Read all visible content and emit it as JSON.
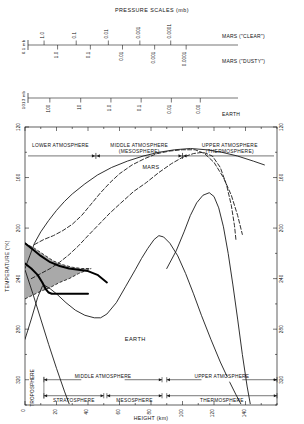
{
  "figure": {
    "pressure_scales_title": "PRESSURE SCALES (mb)",
    "xlabel": "HEIGHT (km)",
    "ylabel": "TEMPERATURE (°K)"
  },
  "pressure_scales": [
    {
      "name": "mars-clear",
      "row_label": "MARS (\"CLEAR\")",
      "origin_label": "6.1 mb",
      "side": "above",
      "ticks": [
        {
          "label": "1.0",
          "km": 12.5
        },
        {
          "label": "0.1",
          "km": 37.5
        },
        {
          "label": "0.01",
          "km": 62.5
        },
        {
          "label": "0.001",
          "km": 87.0
        },
        {
          "label": "0.0001",
          "km": 111.0
        }
      ]
    },
    {
      "name": "mars-dusty",
      "row_label": "MARS (\"DUSTY\")",
      "origin_label": "",
      "side": "below",
      "ticks": [
        {
          "label": "1.0",
          "km": 23.0
        },
        {
          "label": "0.1",
          "km": 48.5
        },
        {
          "label": "0.01",
          "km": 73.5
        },
        {
          "label": "0.001",
          "km": 98.5
        },
        {
          "label": "0.0001",
          "km": 123.0
        }
      ]
    },
    {
      "name": "earth",
      "row_label": "EARTH",
      "origin_label": "1013 mb",
      "side": "below",
      "ticks": [
        {
          "label": "100",
          "km": 17.0
        },
        {
          "label": "10",
          "km": 41.0
        },
        {
          "label": "1.0",
          "km": 64.5
        },
        {
          "label": "0.1",
          "km": 88.0
        },
        {
          "label": "0.01",
          "km": 111.5
        },
        {
          "label": "0.00",
          "km": 134.0
        }
      ]
    }
  ],
  "chart_data": {
    "type": "line",
    "title": "",
    "xlabel": "HEIGHT (km)",
    "ylabel": "TEMPERATURE (°K)",
    "xlim": [
      0,
      160
    ],
    "ylim": [
      120,
      340
    ],
    "y_inverted": true,
    "xticks": [
      0,
      20,
      40,
      60,
      80,
      100,
      120,
      140
    ],
    "xticks_minor_step": 10,
    "yticks": [
      120,
      160,
      200,
      240,
      280,
      320
    ],
    "yticks_minor_step": 20,
    "grid": false,
    "legend": "none",
    "annotations": [
      {
        "text": "MARS",
        "km": 80,
        "k": 137
      },
      {
        "text": "EARTH",
        "km": 70,
        "k": 289
      }
    ],
    "series": [
      {
        "name": "Mars thermosphere upper (solid)",
        "style": "solid",
        "width": 0.9,
        "points": [
          [
            0,
            232
          ],
          [
            3,
            222
          ],
          [
            6,
            212
          ],
          [
            10,
            203
          ],
          [
            15,
            194
          ],
          [
            20,
            186
          ],
          [
            25,
            179
          ],
          [
            30,
            173
          ],
          [
            38,
            165
          ],
          [
            46,
            158
          ],
          [
            55,
            152
          ],
          [
            65,
            147
          ],
          [
            75,
            143
          ],
          [
            85,
            140
          ],
          [
            95,
            138
          ],
          [
            105,
            137
          ],
          [
            115,
            138
          ],
          [
            125,
            140
          ],
          [
            135,
            143
          ],
          [
            145,
            147
          ],
          [
            152,
            150
          ]
        ]
      },
      {
        "name": "Mars thermosphere mid (dashed)",
        "style": "dashed",
        "width": 0.9,
        "points": [
          [
            6,
            213
          ],
          [
            12,
            209
          ],
          [
            18,
            206
          ],
          [
            24,
            202
          ],
          [
            30,
            197
          ],
          [
            36,
            190
          ],
          [
            42,
            181
          ],
          [
            48,
            172
          ],
          [
            54,
            164
          ],
          [
            60,
            157
          ],
          [
            68,
            150
          ],
          [
            76,
            145
          ],
          [
            84,
            141
          ],
          [
            92,
            139
          ],
          [
            100,
            138
          ],
          [
            108,
            138
          ],
          [
            114,
            141
          ],
          [
            120,
            148
          ],
          [
            126,
            160
          ],
          [
            131,
            174
          ],
          [
            135,
            190
          ],
          [
            138,
            205
          ]
        ]
      },
      {
        "name": "Mars thermosphere low (dashed)",
        "style": "dashed",
        "width": 0.9,
        "points": [
          [
            4,
            240
          ],
          [
            10,
            236
          ],
          [
            16,
            232
          ],
          [
            22,
            227
          ],
          [
            28,
            221
          ],
          [
            34,
            214
          ],
          [
            40,
            206
          ],
          [
            47,
            197
          ],
          [
            54,
            188
          ],
          [
            61,
            180
          ],
          [
            69,
            171
          ],
          [
            77,
            164
          ],
          [
            85,
            156
          ],
          [
            93,
            149
          ],
          [
            100,
            144
          ],
          [
            107,
            141
          ],
          [
            113,
            140
          ],
          [
            119,
            143
          ],
          [
            124,
            152
          ],
          [
            128,
            166
          ],
          [
            131,
            182
          ],
          [
            133,
            198
          ],
          [
            134,
            210
          ]
        ]
      },
      {
        "name": "Mars cold profile (solid right)",
        "style": "solid",
        "width": 0.9,
        "points": [
          [
            90,
            232
          ],
          [
            96,
            218
          ],
          [
            101,
            203
          ],
          [
            105,
            190
          ],
          [
            109,
            180
          ],
          [
            113,
            174
          ],
          [
            117,
            172
          ],
          [
            120,
            175
          ],
          [
            123,
            184
          ],
          [
            126,
            199
          ],
          [
            129,
            220
          ],
          [
            132,
            245
          ],
          [
            135,
            272
          ],
          [
            138,
            300
          ],
          [
            141,
            325
          ],
          [
            143,
            339
          ]
        ]
      },
      {
        "name": "Earth profile",
        "style": "solid",
        "width": 0.9,
        "points": [
          [
            0,
            288
          ],
          [
            4,
            272
          ],
          [
            8,
            255
          ],
          [
            11,
            246
          ],
          [
            12,
            245
          ],
          [
            16,
            248
          ],
          [
            20,
            252
          ],
          [
            26,
            259
          ],
          [
            32,
            265
          ],
          [
            38,
            269
          ],
          [
            44,
            271
          ],
          [
            48,
            271
          ],
          [
            52,
            268
          ],
          [
            58,
            259
          ],
          [
            64,
            246
          ],
          [
            70,
            233
          ],
          [
            74,
            224
          ],
          [
            78,
            216
          ],
          [
            82,
            209
          ],
          [
            85,
            206
          ],
          [
            88,
            207
          ],
          [
            92,
            212
          ],
          [
            97,
            222
          ],
          [
            102,
            236
          ],
          [
            107,
            252
          ],
          [
            112,
            269
          ],
          [
            118,
            288
          ],
          [
            124,
            306
          ],
          [
            130,
            322
          ],
          [
            134,
            332
          ],
          [
            137,
            339
          ]
        ]
      },
      {
        "name": "Earth lower tail",
        "style": "solid",
        "width": 0.9,
        "points": [
          [
            0,
            233
          ],
          [
            5,
            252
          ],
          [
            10,
            272
          ],
          [
            15,
            292
          ],
          [
            20,
            311
          ],
          [
            25,
            329
          ],
          [
            28,
            339
          ]
        ]
      }
    ],
    "band": {
      "name": "Mars surface temperature range (shaded)",
      "style": "dashed-outline",
      "fill": "#a9a9a9",
      "upper": [
        [
          0,
          212
        ],
        [
          6,
          216
        ],
        [
          12,
          221
        ],
        [
          18,
          226
        ],
        [
          24,
          229
        ],
        [
          30,
          231
        ],
        [
          36,
          232
        ],
        [
          42,
          232
        ]
      ],
      "lower": [
        [
          0,
          256
        ],
        [
          5,
          253
        ],
        [
          10,
          250
        ],
        [
          16,
          247
        ],
        [
          22,
          243
        ],
        [
          28,
          240
        ],
        [
          34,
          236
        ],
        [
          42,
          232
        ]
      ]
    },
    "thick_curve": {
      "name": "Mars mean surface profile (thick)",
      "points": [
        [
          0,
          228
        ],
        [
          4,
          232
        ],
        [
          8,
          237
        ],
        [
          11,
          243
        ],
        [
          13,
          248
        ],
        [
          15,
          251
        ],
        [
          17,
          252
        ],
        [
          22,
          252
        ],
        [
          28,
          252
        ],
        [
          34,
          252
        ],
        [
          40,
          252
        ]
      ],
      "width": 2.0
    },
    "thick_curve2": {
      "name": "Mars upper mean profile (thick)",
      "points": [
        [
          0,
          212
        ],
        [
          5,
          217
        ],
        [
          10,
          222
        ],
        [
          16,
          227
        ],
        [
          22,
          230
        ],
        [
          28,
          232
        ],
        [
          34,
          233
        ],
        [
          40,
          234
        ],
        [
          46,
          237
        ],
        [
          52,
          243
        ]
      ],
      "width": 1.9
    }
  },
  "mars_regions": {
    "group_label": "MARS",
    "bar_y_k": 150,
    "bands": [
      {
        "name": "lower-atmosphere",
        "line1": "LOWER ATMOSPHERE",
        "line2": "",
        "from_km": 0,
        "to_km": 45
      },
      {
        "name": "middle-atmosphere",
        "line1": "MIDDLE ATMOSPHERE",
        "line2": "(MESOSPHERE)",
        "from_km": 45,
        "to_km": 100
      },
      {
        "name": "upper-atmosphere",
        "line1": "UPPER ATMOSPHERE",
        "line2": "(THERMOSPHERE)",
        "from_km": 100,
        "to_km": 160
      }
    ]
  },
  "earth_regions": {
    "group_label": "EARTH",
    "troposphere_label": "TROPOSPHERE",
    "row1": [
      {
        "name": "middle-atmosphere",
        "label": "MIDDLE ATMOSPHERE",
        "from_km": 12,
        "to_km": 87
      },
      {
        "name": "upper-atmosphere",
        "label": "UPPER ATMOSPHERE",
        "from_km": 90,
        "to_km": 160
      }
    ],
    "row2": [
      {
        "name": "stratosphere",
        "label": "STRATOSPHERE",
        "from_km": 12,
        "to_km": 50
      },
      {
        "name": "mesosphere",
        "label": "MESOSPHERE",
        "from_km": 52,
        "to_km": 87
      },
      {
        "name": "thermosphere",
        "label": "THERMOSPHERE",
        "from_km": 90,
        "to_km": 160
      }
    ]
  },
  "colors": {
    "axis": "#1a1a1a",
    "band_fill": "#a9a9a9",
    "curve": "#1a1a1a",
    "text": "#111111"
  }
}
